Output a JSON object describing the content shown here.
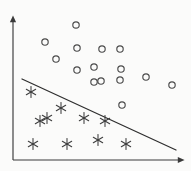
{
  "figure": {
    "background_color": "#fbfbfa",
    "width": 191,
    "height": 171
  },
  "axes": {
    "origin": [
      13,
      160
    ],
    "y_axis": {
      "name": "vertical-axis",
      "from": [
        13,
        160
      ],
      "to": [
        13,
        19
      ],
      "arrow": "up",
      "color": "#3a3a3a"
    },
    "x_axis": {
      "name": "horizontal-axis",
      "from": [
        13,
        160
      ],
      "to": [
        181,
        160
      ],
      "arrow": "right",
      "color": "#3a3a3a"
    },
    "tick_labels": [],
    "grid": false
  },
  "boundary": {
    "name": "decision-boundary",
    "label": "",
    "from": [
      22,
      79
    ],
    "to": [
      176,
      150
    ],
    "color": "#2e2e2e"
  },
  "chart_data": {
    "type": "scatter",
    "title": "",
    "xlabel": "",
    "ylabel": "",
    "xlim": [
      13,
      181
    ],
    "ylim": [
      160,
      19
    ],
    "grid": false,
    "legend": "none",
    "series": [
      {
        "name": "class-circles",
        "marker": "circle",
        "color": "#4a4a4a",
        "count": 15,
        "radius": 3.2,
        "points": [
          [
            76,
            25
          ],
          [
            45,
            42
          ],
          [
            77,
            48
          ],
          [
            102,
            49
          ],
          [
            120,
            49
          ],
          [
            56,
            59
          ],
          [
            94,
            67
          ],
          [
            77,
            70
          ],
          [
            121,
            69
          ],
          [
            94,
            82
          ],
          [
            101,
            81
          ],
          [
            120,
            80
          ],
          [
            146,
            77
          ],
          [
            172,
            85
          ],
          [
            122,
            105
          ]
        ]
      },
      {
        "name": "class-asterisks",
        "marker": "asterisk",
        "color": "#3c3c3c",
        "count": 10,
        "radius": 5.4,
        "points": [
          [
            31,
            92
          ],
          [
            61,
            108
          ],
          [
            47,
            118
          ],
          [
            84,
            118
          ],
          [
            33,
            144
          ],
          [
            67,
            144
          ],
          [
            98,
            140
          ],
          [
            126,
            144
          ],
          [
            105,
            121
          ],
          [
            40,
            121
          ]
        ]
      }
    ]
  }
}
